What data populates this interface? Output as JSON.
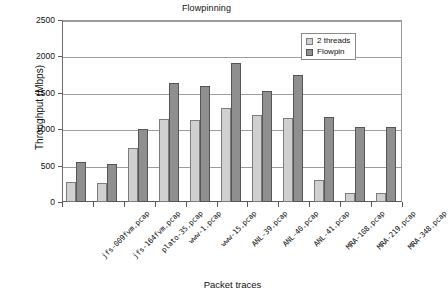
{
  "chart_data": {
    "type": "bar",
    "title": "Flowpinning",
    "xlabel": "Packet traces",
    "ylabel": "Throughput (Mbps)",
    "ylim": [
      0,
      2500
    ],
    "ytick_labels": [
      "0",
      "500",
      "1000",
      "1500",
      "2000",
      "2500"
    ],
    "yticks": [
      0,
      500,
      1000,
      1500,
      2000,
      2500
    ],
    "grid": true,
    "legend_position": "top-right",
    "categories": [
      "jfs-009fvm.pcap",
      "jfs-164fvm.pcap",
      "plato-35.pcap",
      "www-1.pcap",
      "www-15.pcap",
      "ANL-39.pcap",
      "ANL-40.pcap",
      "ANL-41.pcap",
      "MRA-108.pcap",
      "MRA-219.pcap",
      "MRA-348.pcap"
    ],
    "series": [
      {
        "name": "2 threads",
        "color": "#d0d0d0",
        "values": [
          280,
          265,
          735,
          1135,
          1120,
          1290,
          1190,
          1155,
          300,
          125,
          125
        ]
      },
      {
        "name": "Flowpin",
        "color": "#8f8f8f",
        "values": [
          555,
          525,
          1005,
          1635,
          1595,
          1915,
          1530,
          1745,
          1170,
          1035,
          1035
        ]
      }
    ]
  }
}
